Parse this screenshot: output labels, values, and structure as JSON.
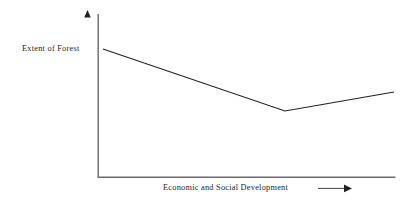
{
  "figure": {
    "background_color": "#ffffff",
    "line_color": "#231f20",
    "text_color": "#231f20"
  },
  "labels": {
    "y_axis": "Extent of Forest",
    "x_axis": "Economic and Social Development"
  },
  "icons": {
    "y_axis_arrowhead": "arrow-up-icon",
    "x_axis_direction_arrow": "arrow-right-icon"
  },
  "chart_data": {
    "type": "line",
    "title": "",
    "subtitle": "",
    "xlabel": "Economic and Social Development",
    "ylabel": "Extent of Forest",
    "grid": false,
    "legend": null,
    "annotations": [],
    "axis_style": "arrow-headed schematic axes, no tick marks, no tick labels",
    "xlim": [
      0,
      1
    ],
    "ylim": [
      0,
      1
    ],
    "x_tick_labels": [],
    "y_tick_labels": [],
    "series": [
      {
        "name": "Forest extent",
        "x": [
          0.017,
          0.629,
          1.0
        ],
        "y": [
          0.785,
          0.405,
          0.521
        ],
        "points_pixels": [
          [
            103,
            49
          ],
          [
            285,
            111
          ],
          [
            394,
            92
          ]
        ]
      }
    ]
  }
}
